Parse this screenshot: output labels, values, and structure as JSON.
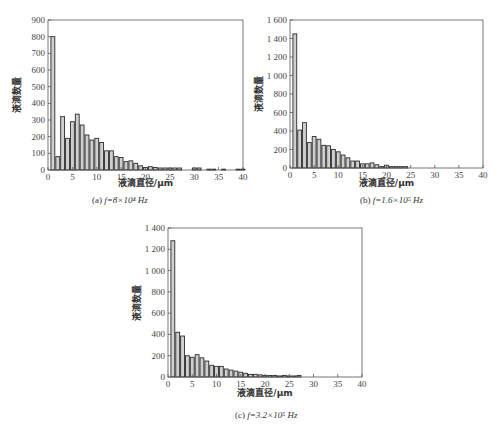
{
  "chart_data": [
    {
      "id": "a",
      "type": "bar",
      "title": "",
      "caption_prefix": "(a)",
      "caption_formula": "f=8×10⁴ Hz",
      "xlabel": "液滴直径/μm",
      "ylabel": "液滴数量",
      "xlim": [
        0,
        40
      ],
      "ylim": [
        0,
        900
      ],
      "xticks": [
        0,
        5,
        10,
        15,
        20,
        25,
        30,
        35,
        40
      ],
      "yticks": [
        0,
        100,
        200,
        300,
        400,
        500,
        600,
        700,
        800,
        900
      ],
      "ytick_labels": [
        "0",
        "100",
        "200",
        "300",
        "400",
        "500",
        "600",
        "700",
        "800",
        "900"
      ],
      "bin_width": 1,
      "x": [
        1,
        2,
        3,
        4,
        5,
        6,
        7,
        8,
        9,
        10,
        11,
        12,
        13,
        14,
        15,
        16,
        17,
        18,
        19,
        20,
        21,
        22,
        23,
        24,
        25,
        26,
        27,
        28,
        29,
        30,
        31,
        32,
        33,
        34,
        35,
        36,
        37,
        38,
        39,
        40
      ],
      "values": [
        800,
        80,
        320,
        190,
        290,
        335,
        270,
        210,
        180,
        190,
        165,
        115,
        115,
        80,
        75,
        50,
        55,
        40,
        25,
        15,
        20,
        15,
        12,
        12,
        12,
        12,
        12,
        0,
        0,
        12,
        12,
        0,
        5,
        5,
        0,
        5,
        0,
        0,
        5,
        5
      ],
      "grid": false,
      "legend": null
    },
    {
      "id": "b",
      "type": "bar",
      "title": "",
      "caption_prefix": "(b)",
      "caption_formula": "f=1.6×10⁵ Hz",
      "xlabel": "液滴直径/μm",
      "ylabel": "液滴数量",
      "xlim": [
        0,
        40
      ],
      "ylim": [
        0,
        1600
      ],
      "xticks": [
        0,
        5,
        10,
        15,
        20,
        25,
        30,
        35,
        40
      ],
      "yticks": [
        0,
        200,
        400,
        600,
        800,
        1000,
        1200,
        1400,
        1600
      ],
      "ytick_labels": [
        "0",
        "200",
        "400",
        "600",
        "800",
        "1 000",
        "1 200",
        "1 400",
        "1 600"
      ],
      "bin_width": 1,
      "x": [
        1,
        2,
        3,
        4,
        5,
        6,
        7,
        8,
        9,
        10,
        11,
        12,
        13,
        14,
        15,
        16,
        17,
        18,
        19,
        20,
        21,
        22,
        23,
        24
      ],
      "values": [
        1450,
        410,
        490,
        275,
        340,
        310,
        245,
        240,
        200,
        175,
        140,
        110,
        75,
        75,
        45,
        45,
        55,
        35,
        15,
        30,
        15,
        15,
        15,
        15
      ],
      "grid": false,
      "legend": null
    },
    {
      "id": "c",
      "type": "bar",
      "title": "",
      "caption_prefix": "(c)",
      "caption_formula": "f=3.2×10⁵ Hz",
      "xlabel": "液滴直径/μm",
      "ylabel": "液滴数量",
      "xlim": [
        0,
        40
      ],
      "ylim": [
        0,
        1400
      ],
      "xticks": [
        0,
        5,
        10,
        15,
        20,
        25,
        30,
        35,
        40
      ],
      "yticks": [
        0,
        200,
        400,
        600,
        800,
        1000,
        1200,
        1400
      ],
      "ytick_labels": [
        "0",
        "200",
        "400",
        "600",
        "800",
        "1 000",
        "1 200",
        "1 400"
      ],
      "bin_width": 1,
      "x": [
        1,
        2,
        3,
        4,
        5,
        6,
        7,
        8,
        9,
        10,
        11,
        12,
        13,
        14,
        15,
        16,
        17,
        18,
        19,
        20,
        21,
        22,
        23,
        24,
        25,
        26,
        27
      ],
      "values": [
        1280,
        420,
        385,
        200,
        185,
        210,
        180,
        150,
        110,
        100,
        100,
        75,
        65,
        55,
        45,
        35,
        25,
        25,
        20,
        15,
        15,
        15,
        10,
        15,
        10,
        10,
        15
      ],
      "grid": false,
      "legend": null
    }
  ],
  "style": {
    "bar_fill": "#cfcfcf",
    "bar_stroke": "#2b2b2b",
    "axis_color": "#555555"
  },
  "panels": [
    {
      "id": "a",
      "left": 48,
      "top": 20,
      "width": 195,
      "height": 150,
      "caption_x": 92,
      "caption_y": 195,
      "xlabel_y": 178
    },
    {
      "id": "b",
      "left": 290,
      "top": 20,
      "width": 193,
      "height": 148,
      "caption_x": 360,
      "caption_y": 195,
      "xlabel_y": 178
    },
    {
      "id": "c",
      "left": 168,
      "top": 228,
      "width": 194,
      "height": 149,
      "caption_x": 235,
      "caption_y": 410,
      "xlabel_y": 388
    }
  ]
}
